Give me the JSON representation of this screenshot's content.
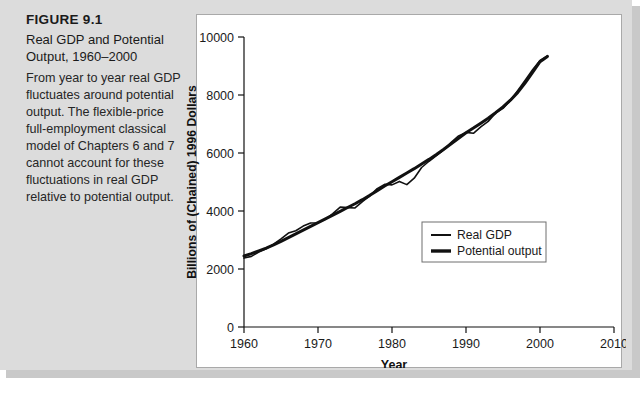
{
  "figure": {
    "number": "FIGURE 9.1",
    "title": "Real GDP and Potential Output, 1960–2000",
    "caption": "From year to year real GDP fluctuates around potential output. The flexible-price full-employment classical model of Chapters 6 and 7 cannot account for these fluctuations in real GDP relative to potential output."
  },
  "chart_data": {
    "type": "line",
    "title": "",
    "xlabel": "Year",
    "ylabel": "Billions of (Chained) 1996 Dollars",
    "xlim": [
      1960,
      2010
    ],
    "ylim": [
      0,
      10000
    ],
    "xticks": [
      "1960",
      "1970",
      "1980",
      "1990",
      "2000",
      "2010"
    ],
    "xtick_values": [
      1960,
      1970,
      1980,
      1990,
      2000,
      2010
    ],
    "yticks": [
      "0",
      "2000",
      "4000",
      "6000",
      "8000",
      "10000"
    ],
    "ytick_values": [
      0,
      2000,
      4000,
      6000,
      8000,
      10000
    ],
    "grid": false,
    "legend_position": "lower right",
    "x": [
      1960,
      1961,
      1962,
      1963,
      1964,
      1965,
      1966,
      1967,
      1968,
      1969,
      1970,
      1971,
      1972,
      1973,
      1974,
      1975,
      1976,
      1977,
      1978,
      1979,
      1980,
      1981,
      1982,
      1983,
      1984,
      1985,
      1986,
      1987,
      1988,
      1989,
      1990,
      1991,
      1992,
      1993,
      1994,
      1995,
      1996,
      1997,
      1998,
      1999,
      2000,
      2001
    ],
    "series": [
      {
        "name": "Real GDP",
        "values": [
          2377,
          2436,
          2585,
          2700,
          2857,
          3040,
          3240,
          3320,
          3480,
          3588,
          3597,
          3714,
          3910,
          4134,
          4117,
          4105,
          4325,
          4520,
          4770,
          4920,
          4900,
          5020,
          4910,
          5130,
          5500,
          5715,
          5912,
          6110,
          6370,
          6590,
          6710,
          6680,
          6900,
          7090,
          7380,
          7540,
          7810,
          8160,
          8510,
          8870,
          9190,
          9350
        ],
        "color": "#111111",
        "line_width": 1.6
      },
      {
        "name": "Potential output",
        "values": [
          2450,
          2530,
          2625,
          2720,
          2830,
          2950,
          3080,
          3210,
          3340,
          3470,
          3600,
          3730,
          3860,
          3990,
          4120,
          4250,
          4390,
          4540,
          4700,
          4860,
          5010,
          5160,
          5310,
          5460,
          5620,
          5780,
          5950,
          6130,
          6320,
          6510,
          6700,
          6860,
          7030,
          7200,
          7390,
          7590,
          7820,
          8090,
          8420,
          8780,
          9150,
          9330
        ],
        "color": "#111111",
        "line_width": 3.0
      }
    ]
  },
  "legend": {
    "items": [
      {
        "label": "Real GDP",
        "swatch_width": 2.0
      },
      {
        "label": "Potential output",
        "swatch_width": 3.4
      }
    ]
  }
}
